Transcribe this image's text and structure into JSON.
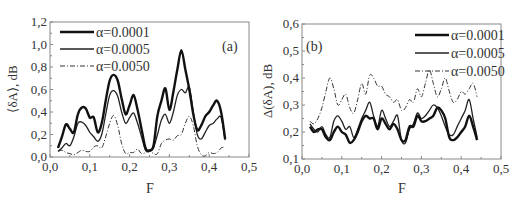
{
  "chart_data": [
    {
      "type": "line",
      "panel_label": "(a)",
      "title": "",
      "xlabel": "F",
      "ylabel": "⟨δA⟩, dB",
      "xlim": [
        0.0,
        0.5
      ],
      "ylim": [
        0.0,
        1.2
      ],
      "xticks": [
        "0,0",
        "0,1",
        "0,2",
        "0,3",
        "0,4",
        "0,5"
      ],
      "yticks": [
        "0,0",
        "0,2",
        "0,4",
        "0,6",
        "0,8",
        "1,0",
        "1,2"
      ],
      "grid": false,
      "legend_position": "upper-left",
      "x": [
        0.02,
        0.03,
        0.04,
        0.05,
        0.06,
        0.07,
        0.08,
        0.09,
        0.1,
        0.11,
        0.12,
        0.13,
        0.14,
        0.15,
        0.16,
        0.17,
        0.18,
        0.19,
        0.2,
        0.21,
        0.22,
        0.23,
        0.24,
        0.25,
        0.26,
        0.27,
        0.28,
        0.29,
        0.3,
        0.31,
        0.32,
        0.33,
        0.34,
        0.35,
        0.36,
        0.37,
        0.38,
        0.39,
        0.4,
        0.41,
        0.42,
        0.43,
        0.44
      ],
      "series": [
        {
          "name": "α=0.0001",
          "style": "thick-solid",
          "values": [
            0.08,
            0.18,
            0.29,
            0.25,
            0.22,
            0.38,
            0.44,
            0.43,
            0.35,
            0.35,
            0.22,
            0.3,
            0.5,
            0.68,
            0.73,
            0.68,
            0.52,
            0.38,
            0.46,
            0.55,
            0.42,
            0.25,
            0.08,
            0.06,
            0.1,
            0.37,
            0.5,
            0.61,
            0.42,
            0.58,
            0.78,
            0.95,
            0.78,
            0.6,
            0.38,
            0.24,
            0.28,
            0.36,
            0.4,
            0.46,
            0.5,
            0.4,
            0.16
          ]
        },
        {
          "name": "α=0.0005",
          "style": "thin-solid",
          "values": [
            0.05,
            0.08,
            0.12,
            0.1,
            0.18,
            0.3,
            0.31,
            0.28,
            0.22,
            0.18,
            0.14,
            0.2,
            0.38,
            0.55,
            0.59,
            0.54,
            0.4,
            0.3,
            0.35,
            0.39,
            0.3,
            0.18,
            0.06,
            0.05,
            0.08,
            0.2,
            0.33,
            0.38,
            0.3,
            0.4,
            0.55,
            0.6,
            0.57,
            0.62,
            0.4,
            0.2,
            0.16,
            0.22,
            0.28,
            0.3,
            0.34,
            0.35,
            0.15
          ]
        },
        {
          "name": "α=0.0050",
          "style": "dash-dot",
          "values": [
            0.05,
            0.06,
            0.04,
            0.03,
            0.02,
            0.04,
            0.06,
            0.05,
            0.05,
            0.09,
            0.1,
            0.08,
            0.18,
            0.3,
            0.37,
            0.28,
            0.12,
            0.03,
            0.04,
            0.04,
            0.07,
            0.03,
            0.04,
            0.06,
            0.03,
            0.03,
            0.12,
            0.15,
            0.16,
            0.15,
            0.19,
            0.2,
            0.3,
            0.36,
            0.28,
            0.1,
            0.02,
            0.01,
            0.04,
            0.03,
            0.04,
            0.08,
            0.09
          ]
        }
      ]
    },
    {
      "type": "line",
      "panel_label": "(b)",
      "title": "",
      "xlabel": "F",
      "ylabel": "Δ(δA), dB",
      "xlim": [
        0.0,
        0.5
      ],
      "ylim": [
        0.1,
        0.6
      ],
      "xticks": [
        "0,0",
        "0,1",
        "0,2",
        "0,3",
        "0,4",
        "0,5"
      ],
      "yticks": [
        "0,1",
        "0,2",
        "0,3",
        "0,4",
        "0,5",
        "0,6"
      ],
      "grid": false,
      "legend_position": "upper-right",
      "x": [
        0.02,
        0.03,
        0.04,
        0.05,
        0.06,
        0.07,
        0.08,
        0.09,
        0.1,
        0.11,
        0.12,
        0.13,
        0.14,
        0.15,
        0.16,
        0.17,
        0.18,
        0.19,
        0.2,
        0.21,
        0.22,
        0.23,
        0.24,
        0.25,
        0.26,
        0.27,
        0.28,
        0.29,
        0.3,
        0.31,
        0.32,
        0.33,
        0.34,
        0.35,
        0.36,
        0.37,
        0.38,
        0.39,
        0.4,
        0.41,
        0.42,
        0.43,
        0.44
      ],
      "series": [
        {
          "name": "α=0.0001",
          "style": "thick-solid",
          "values": [
            0.22,
            0.2,
            0.21,
            0.21,
            0.18,
            0.17,
            0.2,
            0.22,
            0.2,
            0.19,
            0.16,
            0.17,
            0.2,
            0.24,
            0.26,
            0.25,
            0.25,
            0.21,
            0.25,
            0.23,
            0.21,
            0.23,
            0.21,
            0.17,
            0.17,
            0.22,
            0.22,
            0.26,
            0.24,
            0.24,
            0.25,
            0.26,
            0.29,
            0.28,
            0.25,
            0.18,
            0.17,
            0.18,
            0.2,
            0.22,
            0.26,
            0.22,
            0.17
          ]
        },
        {
          "name": "α=0.0005",
          "style": "thin-solid",
          "values": [
            0.23,
            0.21,
            0.2,
            0.22,
            0.19,
            0.18,
            0.24,
            0.26,
            0.24,
            0.21,
            0.22,
            0.18,
            0.21,
            0.25,
            0.28,
            0.31,
            0.26,
            0.22,
            0.28,
            0.25,
            0.22,
            0.24,
            0.26,
            0.17,
            0.16,
            0.21,
            0.23,
            0.27,
            0.25,
            0.26,
            0.28,
            0.3,
            0.29,
            0.26,
            0.22,
            0.19,
            0.19,
            0.22,
            0.25,
            0.28,
            0.32,
            0.25,
            0.18
          ]
        },
        {
          "name": "α=0.0050",
          "style": "dash-dot",
          "values": [
            0.24,
            0.23,
            0.25,
            0.29,
            0.35,
            0.4,
            0.36,
            0.3,
            0.32,
            0.34,
            0.29,
            0.27,
            0.32,
            0.38,
            0.34,
            0.41,
            0.4,
            0.37,
            0.37,
            0.34,
            0.33,
            0.31,
            0.32,
            0.28,
            0.29,
            0.32,
            0.31,
            0.36,
            0.33,
            0.38,
            0.43,
            0.38,
            0.33,
            0.36,
            0.4,
            0.35,
            0.31,
            0.32,
            0.35,
            0.34,
            0.36,
            0.38,
            0.33
          ]
        }
      ]
    }
  ]
}
